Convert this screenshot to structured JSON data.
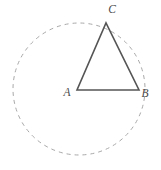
{
  "figure": {
    "type": "euclidean-geometry-diagram",
    "background_color": "#ffffff",
    "canvas": {
      "width": 161,
      "height": 170
    }
  },
  "circle": {
    "name": "dashed-circle",
    "center": {
      "x": 79,
      "y": 89
    },
    "radius": 66,
    "stroke_color": "#a8a8a8",
    "stroke_width": 1,
    "dash_pattern": "4 4",
    "fill": "none",
    "style": "dashed"
  },
  "triangle": {
    "name": "triangle-abc",
    "stroke_color": "#555555",
    "stroke_width": 1.6,
    "fill": "none",
    "vertices": [
      {
        "id": "A",
        "x": 77,
        "y": 90
      },
      {
        "id": "B",
        "x": 139,
        "y": 90
      },
      {
        "id": "C",
        "x": 106,
        "y": 23
      }
    ],
    "edges": [
      {
        "id": "AB",
        "from": "A",
        "to": "B"
      },
      {
        "id": "BC",
        "from": "B",
        "to": "C"
      },
      {
        "id": "CA",
        "from": "C",
        "to": "A"
      }
    ],
    "points_path": "77,90 139,90 106,23"
  },
  "labels": {
    "a": {
      "text": "A",
      "x": 67,
      "y": 96
    },
    "b": {
      "text": "B",
      "x": 145,
      "y": 97
    },
    "c": {
      "text": "C",
      "x": 112,
      "y": 13
    }
  }
}
